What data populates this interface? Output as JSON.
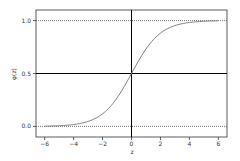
{
  "chart_data": {
    "type": "line",
    "title": "",
    "xlabel": "z",
    "ylabel": "φ(z)",
    "xlim": [
      -6.6,
      6.6
    ],
    "ylim": [
      -0.1,
      1.1
    ],
    "grid": false,
    "legend": null,
    "x_ticks": [
      -6,
      -4,
      -2,
      0,
      2,
      4,
      6
    ],
    "x_tick_labels": [
      "−6",
      "−4",
      "−2",
      "0",
      "2",
      "4",
      "6"
    ],
    "y_ticks": [
      0.0,
      0.5,
      1.0
    ],
    "y_tick_labels": [
      "0.0",
      "0.5",
      "1.0"
    ],
    "series": [
      {
        "name": "sigmoid φ(z) = 1/(1+e^(−z))",
        "x": [
          -6,
          -5,
          -4,
          -3,
          -2,
          -1,
          0,
          1,
          2,
          3,
          4,
          5,
          6
        ],
        "y": [
          0.0025,
          0.0067,
          0.018,
          0.047,
          0.119,
          0.269,
          0.5,
          0.731,
          0.881,
          0.953,
          0.982,
          0.9933,
          0.9975
        ],
        "color": "#7f7f7f"
      }
    ],
    "reference_lines": [
      {
        "orientation": "vertical",
        "value": 0.0,
        "style": "solid",
        "color": "#000000"
      },
      {
        "orientation": "horizontal",
        "value": 0.5,
        "style": "solid",
        "color": "#000000"
      },
      {
        "orientation": "horizontal",
        "value": 1.0,
        "style": "dotted",
        "color": "#555555"
      },
      {
        "orientation": "horizontal",
        "value": 0.0,
        "style": "dotted",
        "color": "#555555"
      }
    ]
  }
}
